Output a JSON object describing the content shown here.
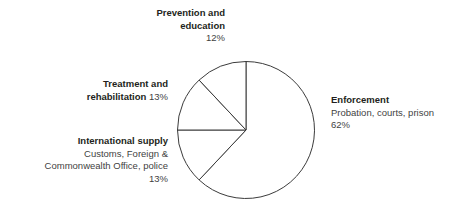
{
  "chart_data": {
    "type": "pie",
    "title": "",
    "subtitle": "",
    "categories": [
      "Enforcement",
      "International supply",
      "Treatment and rehabilitation",
      "Prevention and education"
    ],
    "values": [
      62,
      13,
      13,
      12
    ],
    "unit": "%",
    "legend_position": "around-slices",
    "grid": false,
    "slice_style": {
      "fill": "#ffffff",
      "stroke": "#3b3b3b",
      "stroke_width": 1
    },
    "start_angle_deg": 0,
    "direction": "clockwise",
    "slices": [
      {
        "name": "Enforcement",
        "value": 62,
        "percent_label": "62%",
        "description": "Probation, courts, prison",
        "start_deg": 0,
        "end_deg": 223.2
      },
      {
        "name": "International supply",
        "value": 13,
        "percent_label": "13%",
        "description": "Customs, Foreign & Commonwealth Office, police",
        "start_deg": 223.2,
        "end_deg": 270.0
      },
      {
        "name": "Treatment and rehabilitation",
        "value": 13,
        "percent_label": "13%",
        "description": "",
        "start_deg": 270.0,
        "end_deg": 316.8
      },
      {
        "name": "Prevention and education",
        "value": 12,
        "percent_label": "12%",
        "description": "",
        "start_deg": 316.8,
        "end_deg": 360.0
      }
    ]
  },
  "labels": {
    "prevention": {
      "line1": "Prevention and",
      "line2": "education",
      "percent": "12%"
    },
    "treatment": {
      "line1": "Treatment and",
      "line2_title": "rehabilitation",
      "line2_percent": "13%"
    },
    "international": {
      "title": "International supply",
      "line1": "Customs, Foreign &",
      "line2": "Commonwealth Office, police",
      "percent": "13%"
    },
    "enforcement": {
      "title": "Enforcement",
      "line1": "Probation, courts, prison",
      "percent": "62%"
    }
  },
  "colors": {
    "background": "#ffffff",
    "stroke": "#3b3b3b",
    "heading_text": "#231f20",
    "body_text": "#3f3f3f"
  }
}
